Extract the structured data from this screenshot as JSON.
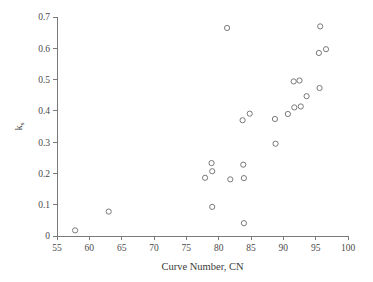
{
  "chart_data": {
    "type": "scatter",
    "title": "",
    "xlabel": "Curve Number, CN",
    "ylabel": "k",
    "ylabel_subscript": "s",
    "xlim": [
      55,
      100
    ],
    "ylim": [
      0,
      0.7
    ],
    "xticks": [
      55,
      60,
      65,
      70,
      75,
      80,
      85,
      90,
      95,
      100
    ],
    "xtick_labels": [
      "55",
      "60",
      "65",
      "70",
      "75",
      "80",
      "85",
      "90",
      "95",
      "100"
    ],
    "yticks": [
      0,
      0.1,
      0.2,
      0.3,
      0.4,
      0.5,
      0.6,
      0.7
    ],
    "ytick_labels": [
      "0",
      "0.1",
      "0.2",
      "0.3",
      "0.4",
      "0.5",
      "0.6",
      "0.7"
    ],
    "grid": false,
    "legend": false,
    "marker": "open-circle",
    "marker_color": "#6b6b6b",
    "points": [
      {
        "x": 57.8,
        "y": 0.018
      },
      {
        "x": 63.0,
        "y": 0.078
      },
      {
        "x": 77.9,
        "y": 0.186
      },
      {
        "x": 78.9,
        "y": 0.233
      },
      {
        "x": 79.0,
        "y": 0.207
      },
      {
        "x": 79.0,
        "y": 0.093
      },
      {
        "x": 81.3,
        "y": 0.665
      },
      {
        "x": 81.8,
        "y": 0.181
      },
      {
        "x": 83.7,
        "y": 0.37
      },
      {
        "x": 83.8,
        "y": 0.228
      },
      {
        "x": 83.9,
        "y": 0.185
      },
      {
        "x": 83.9,
        "y": 0.041
      },
      {
        "x": 84.8,
        "y": 0.391
      },
      {
        "x": 88.7,
        "y": 0.374
      },
      {
        "x": 88.8,
        "y": 0.295
      },
      {
        "x": 90.7,
        "y": 0.39
      },
      {
        "x": 91.6,
        "y": 0.494
      },
      {
        "x": 91.7,
        "y": 0.411
      },
      {
        "x": 92.5,
        "y": 0.497
      },
      {
        "x": 92.7,
        "y": 0.414
      },
      {
        "x": 93.6,
        "y": 0.447
      },
      {
        "x": 95.5,
        "y": 0.585
      },
      {
        "x": 95.6,
        "y": 0.473
      },
      {
        "x": 95.7,
        "y": 0.67
      },
      {
        "x": 96.6,
        "y": 0.597
      }
    ]
  }
}
